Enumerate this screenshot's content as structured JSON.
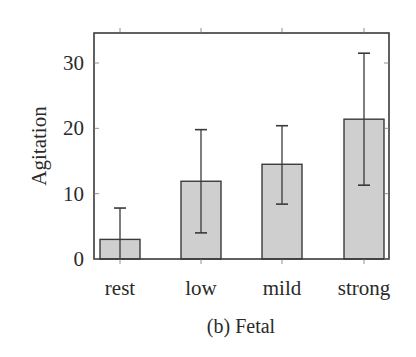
{
  "chart_data": {
    "type": "bar",
    "title": "",
    "caption": "(b) Fetal",
    "xlabel": "",
    "ylabel": "Agitation",
    "categories": [
      "rest",
      "low",
      "mild",
      "strong"
    ],
    "values": [
      3.0,
      11.9,
      14.5,
      21.4
    ],
    "error_bars": {
      "upper": [
        7.8,
        19.8,
        20.4,
        31.5
      ],
      "lower": [
        0.0,
        4.0,
        8.4,
        11.3
      ]
    },
    "ylim": [
      0,
      35
    ],
    "yticks": [
      0,
      10,
      20,
      30
    ],
    "grid": false,
    "legend": null,
    "colors": {
      "bar_fill": "#cfcfcf",
      "bar_stroke": "#3a3a3a",
      "axis": "#3a3a3a",
      "error_bar": "#3a3a3a"
    }
  }
}
